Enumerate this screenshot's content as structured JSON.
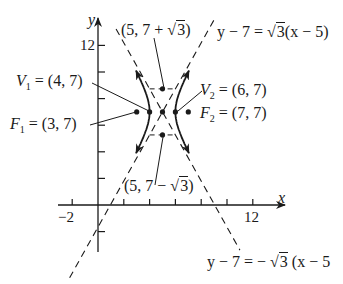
{
  "figure": {
    "type": "hyperbola",
    "equation_center": [
      5,
      7
    ],
    "axes": {
      "x_label": "x",
      "y_label": "y",
      "x_tick_labels": [
        {
          "value": -2,
          "text": "−2"
        },
        {
          "value": 12,
          "text": "12"
        }
      ],
      "y_tick_labels": [
        {
          "value": 12,
          "text": "12"
        }
      ],
      "x_ticks": [
        -2,
        2,
        4,
        6,
        8,
        10,
        12
      ],
      "y_ticks": [
        -2,
        2,
        4,
        6,
        8,
        10,
        12
      ]
    },
    "points": {
      "center": [
        5,
        7
      ],
      "V1": {
        "name": "V",
        "sub": "1",
        "coords": "= (4, 7)",
        "x": 4,
        "y": 7
      },
      "V2": {
        "name": "V",
        "sub": "2",
        "coords": "= (6, 7)",
        "x": 6,
        "y": 7
      },
      "F1": {
        "name": "F",
        "sub": "1",
        "coords": "= (3, 7)",
        "x": 3,
        "y": 7
      },
      "F2": {
        "name": "F",
        "sub": "2",
        "coords": "= (7, 7)",
        "x": 7,
        "y": 7
      },
      "top": {
        "label_prefix": "(5, 7 + ",
        "label_sqrt": "3",
        "label_suffix": ")",
        "x": 5,
        "y": 8.732
      },
      "bottom": {
        "label_prefix": "(5, 7 − ",
        "label_sqrt": "3",
        "label_suffix": ")",
        "x": 5,
        "y": 5.268
      }
    },
    "asymptotes": {
      "positive": {
        "lhs": "y − 7 = ",
        "sqrt": "3",
        "rhs": "(x − 5)"
      },
      "negative": {
        "lhs": "y − 7 = − ",
        "sqrt": "3",
        "rhs": " (x − 5"
      }
    },
    "colors": {
      "ink": "#1a1a1a",
      "background": "#ffffff"
    }
  }
}
